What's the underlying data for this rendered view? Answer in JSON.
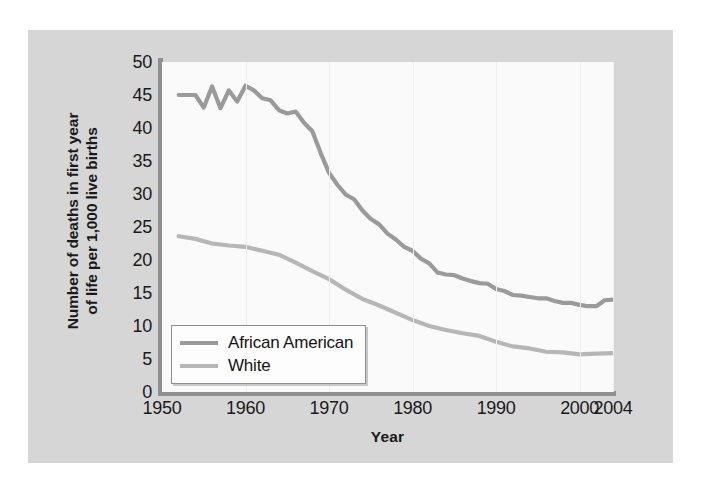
{
  "chart_data": {
    "type": "line",
    "title": "",
    "xlabel": "Year",
    "ylabel_line1": "Number of deaths in first year",
    "ylabel_line2": "of life per 1,000 live births",
    "ylabel": "Number of deaths in first year of life per 1,000 live births",
    "xlim": [
      1950,
      2004
    ],
    "ylim": [
      0,
      50
    ],
    "xticks": [
      "1950",
      "1960",
      "1970",
      "1980",
      "1990",
      "2000",
      "2004"
    ],
    "xtick_values": [
      1950,
      1960,
      1970,
      1980,
      1990,
      2000,
      2004
    ],
    "yticks": [
      "0",
      "5",
      "10",
      "15",
      "20",
      "25",
      "30",
      "35",
      "40",
      "45",
      "50"
    ],
    "ytick_values": [
      0,
      5,
      10,
      15,
      20,
      25,
      30,
      35,
      40,
      45,
      50
    ],
    "grid": "vertical-faint",
    "legend_position": "lower-left-inside",
    "series": [
      {
        "name": "African American",
        "color": "#9a9a9a",
        "x": [
          1952,
          1954,
          1955,
          1956,
          1957,
          1958,
          1959,
          1960,
          1961,
          1962,
          1963,
          1964,
          1965,
          1966,
          1967,
          1968,
          1969,
          1970,
          1971,
          1972,
          1973,
          1974,
          1975,
          1976,
          1977,
          1978,
          1979,
          1980,
          1981,
          1982,
          1983,
          1984,
          1985,
          1986,
          1987,
          1988,
          1989,
          1990,
          1991,
          1992,
          1993,
          1994,
          1995,
          1996,
          1997,
          1998,
          1999,
          2000,
          2001,
          2002,
          2003,
          2004
        ],
        "values": [
          45.0,
          45.0,
          43.1,
          46.3,
          43.0,
          45.7,
          44.0,
          46.4,
          45.7,
          44.5,
          44.2,
          42.7,
          42.2,
          42.5,
          40.8,
          39.5,
          36.2,
          33.2,
          31.4,
          29.9,
          29.2,
          27.5,
          26.2,
          25.4,
          24.0,
          23.1,
          22.0,
          21.4,
          20.2,
          19.5,
          18.1,
          17.8,
          17.7,
          17.2,
          16.8,
          16.5,
          16.4,
          15.6,
          15.3,
          14.7,
          14.6,
          14.4,
          14.2,
          14.2,
          13.8,
          13.5,
          13.5,
          13.2,
          13.0,
          13.0,
          13.9,
          14.0
        ]
      },
      {
        "name": "White",
        "color": "#b6b6b6",
        "x": [
          1952,
          1954,
          1956,
          1958,
          1960,
          1962,
          1964,
          1966,
          1968,
          1970,
          1972,
          1974,
          1976,
          1978,
          1980,
          1982,
          1984,
          1986,
          1988,
          1990,
          1992,
          1994,
          1996,
          1998,
          2000,
          2002,
          2004
        ],
        "values": [
          23.6,
          23.2,
          22.5,
          22.2,
          22.0,
          21.4,
          20.8,
          19.6,
          18.3,
          17.1,
          15.5,
          14.1,
          13.1,
          12.0,
          10.9,
          10.0,
          9.4,
          8.9,
          8.5,
          7.6,
          6.9,
          6.6,
          6.1,
          6.0,
          5.7,
          5.8,
          5.9
        ]
      }
    ]
  },
  "legend": {
    "entries": [
      {
        "label": "African American",
        "color": "#9a9a9a"
      },
      {
        "label": "White",
        "color": "#b6b6b6"
      }
    ]
  },
  "colors": {
    "outer_background": "#ffffff",
    "panel_background": "#d6d6d6",
    "plot_background": "#fafafa",
    "axis": "#8f8f8f",
    "text": "#1a1a1a",
    "african_american_line": "#9a9a9a",
    "white_line": "#b6b6b6"
  }
}
